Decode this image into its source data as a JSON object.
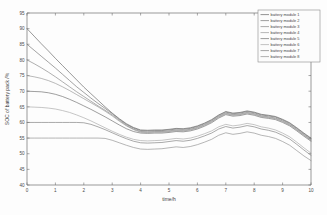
{
  "chart_data": {
    "type": "line",
    "title": "",
    "xlabel": "time/h",
    "ylabel": "SOC of battery pack /%",
    "xlim": [
      0,
      10
    ],
    "ylim": [
      40,
      95
    ],
    "xticks": [
      "0",
      "1",
      "2",
      "3",
      "4",
      "5",
      "6",
      "7",
      "8",
      "9",
      "10"
    ],
    "yticks": [
      "40",
      "45",
      "50",
      "55",
      "60",
      "65",
      "70",
      "75",
      "80",
      "85",
      "90",
      "95"
    ],
    "grid": false,
    "legend_position": "upper right",
    "x": [
      0,
      0.25,
      0.5,
      0.75,
      1,
      1.25,
      1.5,
      1.75,
      2,
      2.25,
      2.5,
      2.75,
      3,
      3.25,
      3.5,
      3.75,
      4,
      4.25,
      4.5,
      4.75,
      5,
      5.25,
      5.5,
      5.75,
      6,
      6.25,
      6.5,
      6.75,
      7,
      7.25,
      7.5,
      7.75,
      8,
      8.25,
      8.5,
      8.75,
      9,
      9.25,
      9.5,
      9.75,
      10
    ],
    "series": [
      {
        "name": "battery module 1",
        "color": "#5a5a5a",
        "values": [
          90.0,
          87.6,
          85.2,
          82.9,
          80.5,
          78.2,
          75.9,
          73.6,
          71.3,
          69.2,
          67.1,
          65.0,
          63.0,
          61.2,
          59.6,
          58.4,
          57.6,
          57.5,
          57.6,
          57.6,
          57.8,
          58.1,
          58.0,
          58.3,
          58.9,
          59.8,
          60.9,
          62.4,
          63.5,
          63.0,
          63.2,
          63.7,
          63.3,
          62.6,
          62.3,
          61.9,
          61.0,
          59.9,
          58.3,
          56.6,
          55.0
        ]
      },
      {
        "name": "battery module 2",
        "color": "#6a6a6a",
        "values": [
          85.0,
          83.1,
          81.2,
          79.3,
          77.4,
          75.4,
          73.4,
          71.4,
          69.6,
          67.8,
          66.1,
          64.5,
          62.8,
          61.0,
          59.4,
          58.2,
          57.4,
          57.3,
          57.4,
          57.4,
          57.6,
          57.9,
          57.8,
          58.1,
          58.7,
          59.6,
          60.7,
          62.2,
          63.3,
          62.8,
          63.0,
          63.5,
          63.1,
          62.4,
          62.1,
          61.7,
          60.8,
          59.7,
          58.1,
          56.4,
          54.8
        ]
      },
      {
        "name": "battery module 3",
        "color": "#7d7d7d",
        "values": [
          80.0,
          78.8,
          77.5,
          76.1,
          74.6,
          73.0,
          71.4,
          69.8,
          68.3,
          66.8,
          65.3,
          63.9,
          62.4,
          60.7,
          59.1,
          57.9,
          57.1,
          57.0,
          57.1,
          57.1,
          57.3,
          57.6,
          57.5,
          57.8,
          58.4,
          59.3,
          60.4,
          61.9,
          63.0,
          62.5,
          62.7,
          63.2,
          62.8,
          62.1,
          61.8,
          61.4,
          60.5,
          59.4,
          57.8,
          56.1,
          54.5
        ]
      },
      {
        "name": "battery module 4",
        "color": "#8f8f8f",
        "values": [
          75.0,
          74.6,
          74.1,
          73.4,
          72.5,
          71.4,
          70.2,
          68.9,
          67.6,
          66.3,
          65.0,
          63.6,
          62.1,
          60.4,
          58.9,
          57.7,
          56.9,
          56.8,
          56.9,
          56.9,
          57.1,
          57.4,
          57.3,
          57.6,
          58.2,
          59.1,
          60.2,
          61.7,
          62.8,
          62.3,
          62.5,
          63.0,
          62.6,
          61.9,
          61.6,
          61.2,
          60.3,
          59.2,
          57.6,
          55.9,
          54.3
        ]
      },
      {
        "name": "battery module 5",
        "color": "#636363",
        "values": [
          70.0,
          69.9,
          69.8,
          69.5,
          69.0,
          68.3,
          67.4,
          66.4,
          65.3,
          64.2,
          63.0,
          61.8,
          60.5,
          59.2,
          58.0,
          57.1,
          56.6,
          56.5,
          56.6,
          56.6,
          56.8,
          57.1,
          57.0,
          57.3,
          57.9,
          58.8,
          59.9,
          61.4,
          62.5,
          62.0,
          62.2,
          62.7,
          62.3,
          61.6,
          61.3,
          60.9,
          60.0,
          58.9,
          57.3,
          55.6,
          54.0
        ]
      },
      {
        "name": "battery module 6",
        "color": "#a2a2a2",
        "values": [
          65.0,
          64.9,
          64.8,
          64.6,
          64.3,
          63.8,
          63.2,
          62.4,
          61.5,
          60.5,
          59.4,
          58.3,
          57.2,
          56.2,
          55.3,
          54.6,
          54.2,
          54.1,
          54.2,
          54.3,
          54.6,
          54.9,
          54.7,
          55.0,
          55.6,
          56.4,
          57.3,
          58.6,
          59.4,
          58.9,
          59.2,
          59.7,
          59.3,
          58.6,
          58.2,
          57.6,
          56.6,
          55.4,
          53.7,
          51.9,
          50.2
        ]
      },
      {
        "name": "battery module 7",
        "color": "#757575",
        "values": [
          60.0,
          60.0,
          60.0,
          60.0,
          60.0,
          60.0,
          60.0,
          60.0,
          59.9,
          59.4,
          58.6,
          57.7,
          56.7,
          55.7,
          54.8,
          54.0,
          53.5,
          53.4,
          53.5,
          53.6,
          53.9,
          54.2,
          54.0,
          54.3,
          54.9,
          55.7,
          56.6,
          57.9,
          58.7,
          58.2,
          58.5,
          59.0,
          58.6,
          57.9,
          57.5,
          56.9,
          55.9,
          54.7,
          53.0,
          51.2,
          49.5
        ]
      },
      {
        "name": "battery module 8",
        "color": "#888888",
        "values": [
          55.0,
          55.0,
          55.0,
          55.0,
          55.0,
          55.0,
          55.0,
          55.0,
          55.0,
          55.0,
          55.0,
          54.9,
          54.3,
          53.5,
          52.7,
          52.0,
          51.5,
          51.4,
          51.5,
          51.6,
          51.9,
          52.2,
          52.0,
          52.3,
          52.9,
          53.7,
          54.6,
          55.9,
          56.7,
          56.2,
          56.5,
          57.0,
          56.6,
          55.9,
          55.5,
          54.9,
          53.9,
          52.7,
          51.0,
          49.3,
          47.8
        ]
      }
    ]
  },
  "legend": {
    "items": [
      {
        "label": "battery module 1"
      },
      {
        "label": "battery module 2"
      },
      {
        "label": "battery module 3"
      },
      {
        "label": "battery module 4"
      },
      {
        "label": "battery module 5"
      },
      {
        "label": "battery module 6"
      },
      {
        "label": "battery module 7"
      },
      {
        "label": "battery module 8"
      }
    ]
  }
}
